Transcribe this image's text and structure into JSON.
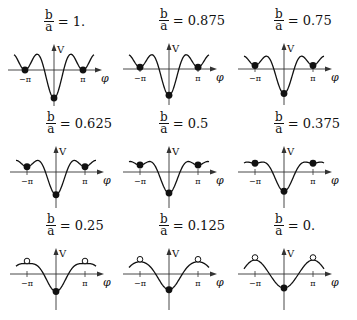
{
  "figure": {
    "axis_labels": {
      "y": "V",
      "x": "φ"
    },
    "tick_labels": {
      "neg_pi": "−π",
      "pos_pi": "π"
    },
    "ratio_numerator": "b",
    "ratio_denominator": "a",
    "equals": "=",
    "colors": {
      "curve": "#111111",
      "background": "#ffffff"
    },
    "panels": [
      {
        "ratio": 1.0,
        "label": "1.",
        "pi_marker": "filled"
      },
      {
        "ratio": 0.875,
        "label": "0.875",
        "pi_marker": "filled"
      },
      {
        "ratio": 0.75,
        "label": "0.75",
        "pi_marker": "filled"
      },
      {
        "ratio": 0.625,
        "label": "0.625",
        "pi_marker": "filled"
      },
      {
        "ratio": 0.5,
        "label": "0.5",
        "pi_marker": "filled"
      },
      {
        "ratio": 0.375,
        "label": "0.375",
        "pi_marker": "filled"
      },
      {
        "ratio": 0.25,
        "label": "0.25",
        "pi_marker": "open"
      },
      {
        "ratio": 0.125,
        "label": "0.125",
        "pi_marker": "open"
      },
      {
        "ratio": 0.0,
        "label": "0.",
        "pi_marker": "open"
      }
    ]
  }
}
